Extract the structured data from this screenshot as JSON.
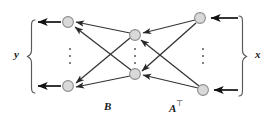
{
  "figure": {
    "type": "bipartite-network-diagram",
    "title": "",
    "background_color": "#ffffff",
    "width": 273,
    "height": 122
  },
  "labels": {
    "left_brace_label": "y",
    "right_brace_label": "x",
    "left_matrix_label": "B",
    "right_matrix_label": "A",
    "right_matrix_superscript": "⊤"
  },
  "colors": {
    "node_fill": "#d9d9d9",
    "node_stroke": "#8c8c8c",
    "edge_stroke": "#333333",
    "arrow_stroke": "#1a1a1a",
    "brace_stroke": "#595959",
    "dot_color": "#4d4d4d",
    "text_color": "#1a1a1a"
  },
  "geometry": {
    "node_radius": 5.5,
    "columns": [
      {
        "name": "output-column",
        "role": "y",
        "x": 68,
        "nodes": [
          {
            "id": "y1",
            "x": 68,
            "y": 22
          },
          {
            "id": "yn",
            "x": 68,
            "y": 86
          }
        ],
        "ellipsis": {
          "x": 70,
          "y": 56
        }
      },
      {
        "name": "hidden-column",
        "role": "hidden",
        "x": 135,
        "nodes": [
          {
            "id": "h1",
            "x": 135,
            "y": 35
          },
          {
            "id": "hn",
            "x": 135,
            "y": 74
          }
        ],
        "ellipsis": {
          "x": 135,
          "y": 56
        }
      },
      {
        "name": "input-column",
        "role": "x",
        "x": 201,
        "nodes": [
          {
            "id": "x1",
            "x": 200,
            "y": 18
          },
          {
            "id": "xn",
            "x": 203,
            "y": 90
          }
        ],
        "ellipsis": {
          "x": 203,
          "y": 56
        }
      }
    ],
    "braces": [
      {
        "name": "left-brace",
        "direction": "open-right",
        "x": 31,
        "top": 20,
        "bottom": 93
      },
      {
        "name": "right-brace",
        "direction": "open-left",
        "x": 243,
        "top": 16,
        "bottom": 96
      }
    ]
  },
  "edges": [
    {
      "from": "x1",
      "to": "h1",
      "group": "A-transpose"
    },
    {
      "from": "x1",
      "to": "hn",
      "group": "A-transpose"
    },
    {
      "from": "xn",
      "to": "h1",
      "group": "A-transpose"
    },
    {
      "from": "xn",
      "to": "hn",
      "group": "A-transpose"
    },
    {
      "from": "h1",
      "to": "y1",
      "group": "B"
    },
    {
      "from": "h1",
      "to": "yn",
      "group": "B"
    },
    {
      "from": "hn",
      "to": "y1",
      "group": "B"
    },
    {
      "from": "hn",
      "to": "yn",
      "group": "B"
    }
  ],
  "external_arrows": [
    {
      "name": "output-arrow-top",
      "from_x": 60,
      "to_x": 37,
      "y": 22,
      "direction": "left"
    },
    {
      "name": "output-arrow-bottom",
      "from_x": 60,
      "to_x": 37,
      "y": 86,
      "direction": "left"
    },
    {
      "name": "input-arrow-top",
      "from_x": 238,
      "to_x": 210,
      "y": 18,
      "direction": "left"
    },
    {
      "name": "input-arrow-bottom",
      "from_x": 238,
      "to_x": 213,
      "y": 90,
      "direction": "left"
    }
  ]
}
